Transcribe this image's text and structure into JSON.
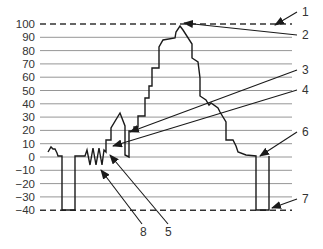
{
  "figure": {
    "type": "waveform-diagram",
    "y_axis": {
      "ticks": [
        100,
        90,
        80,
        70,
        60,
        50,
        40,
        30,
        20,
        10,
        0,
        -10,
        -20,
        -30,
        -40
      ],
      "tick_labels": [
        "100",
        "90",
        "80",
        "70",
        "60",
        "50",
        "40",
        "30",
        "20",
        "10",
        "0",
        "−10",
        "−20",
        "−30",
        "−40"
      ],
      "dashed_reference_lines": [
        100,
        -40
      ]
    },
    "callouts": [
      {
        "label": "1",
        "text_x": 302,
        "text_y": 16,
        "from": [
          297,
          12
        ],
        "to": [
          275,
          25
        ]
      },
      {
        "label": "2",
        "text_x": 302,
        "text_y": 39,
        "from": [
          297,
          35
        ],
        "to": [
          184,
          23
        ]
      },
      {
        "label": "2",
        "text_x": null,
        "text_y": null,
        "from": [
          297,
          35
        ],
        "to": null
      },
      {
        "label": "3",
        "text_x": 302,
        "text_y": 74,
        "from": [
          297,
          70
        ],
        "to": [
          130,
          132
        ]
      },
      {
        "label": "4",
        "text_x": 302,
        "text_y": 94,
        "from": [
          297,
          90
        ],
        "to": [
          113,
          146
        ]
      },
      {
        "label": "5",
        "text_x": 165,
        "text_y": 236,
        "from": [
          168,
          224
        ],
        "to": [
          110,
          155
        ]
      },
      {
        "label": "6",
        "text_x": 302,
        "text_y": 136,
        "from": [
          297,
          132
        ],
        "to": [
          260,
          156
        ]
      },
      {
        "label": "7",
        "text_x": 302,
        "text_y": 203,
        "from": [
          297,
          199
        ],
        "to": [
          272,
          208
        ]
      },
      {
        "label": "8",
        "text_x": 140,
        "text_y": 236,
        "from": [
          142,
          224
        ],
        "to": [
          101,
          170
        ]
      }
    ]
  },
  "chart_data": {
    "type": "line",
    "title": "",
    "xlabel": "",
    "ylabel": "",
    "ylim": [
      -40,
      100
    ],
    "y_ticks": [
      100,
      90,
      80,
      70,
      60,
      50,
      40,
      30,
      20,
      10,
      0,
      -10,
      -20,
      -30,
      -40
    ],
    "grid": true,
    "reference_lines": [
      {
        "y": 100,
        "style": "dashed"
      },
      {
        "y": -40,
        "style": "dashed"
      }
    ],
    "series": [
      {
        "name": "waveform",
        "description": "Flat at 0 with small notch, negative pulse to -40, zigzag noise near 0, stepwise rise to peak ~98, stepwise fall back to 0, second negative pulse to -40",
        "key_points": [
          {
            "label": "baseline start",
            "value": 0
          },
          {
            "label": "first negative pulse",
            "value": -40
          },
          {
            "label": "zigzag (8)",
            "value_range": [
              -5,
              6
            ]
          },
          {
            "label": "small bump",
            "value": 33
          },
          {
            "label": "dip (3)",
            "value": 2
          },
          {
            "label": "peak (2)",
            "value": 98
          },
          {
            "label": "descending shoulder",
            "value": 30
          },
          {
            "label": "return to baseline (6)",
            "value": 0
          },
          {
            "label": "second negative pulse (7)",
            "value": -40
          }
        ]
      }
    ],
    "callout_labels": [
      "1",
      "2",
      "3",
      "4",
      "5",
      "6",
      "7",
      "8"
    ]
  },
  "colors": {
    "background": "#ffffff",
    "grid": "#8a8a8a",
    "waveform": "#1a1a1a",
    "dashed": "#333333",
    "text": "#333333"
  }
}
